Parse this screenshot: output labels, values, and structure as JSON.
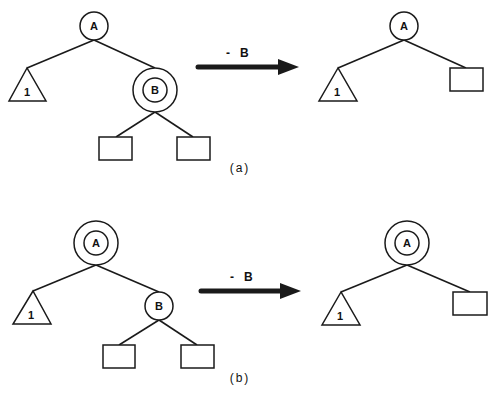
{
  "colors": {
    "ink": "#1a1a1a",
    "background": "#ffffff"
  },
  "panels": [
    {
      "caption": "(a)",
      "operation": {
        "label": "-   B"
      },
      "before": {
        "root": {
          "label": "A",
          "marked": false
        },
        "left_subtree": {
          "label": "1"
        },
        "right_child": {
          "label": "B",
          "marked": true
        },
        "leaves": [
          "",
          ""
        ]
      },
      "after": {
        "root": {
          "label": "A",
          "marked": false
        },
        "left_subtree": {
          "label": "1"
        },
        "right_leaf": ""
      }
    },
    {
      "caption": "(b)",
      "operation": {
        "label": "-   B"
      },
      "before": {
        "root": {
          "label": "A",
          "marked": true
        },
        "left_subtree": {
          "label": "1"
        },
        "right_child": {
          "label": "B",
          "marked": false
        },
        "leaves": [
          "",
          ""
        ]
      },
      "after": {
        "root": {
          "label": "A",
          "marked": true
        },
        "left_subtree": {
          "label": "1"
        },
        "right_leaf": ""
      }
    }
  ]
}
